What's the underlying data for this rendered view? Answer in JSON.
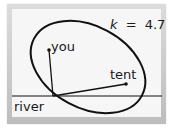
{
  "diagram": {
    "parameter": {
      "symbol": "k",
      "equals": "=",
      "value": "4.7"
    },
    "labels": {
      "you": "you",
      "tent": "tent",
      "river": "river"
    },
    "colors": {
      "stroke": "#111111",
      "panel": "#f6f6f6",
      "frame": "#c4c4c4"
    }
  }
}
